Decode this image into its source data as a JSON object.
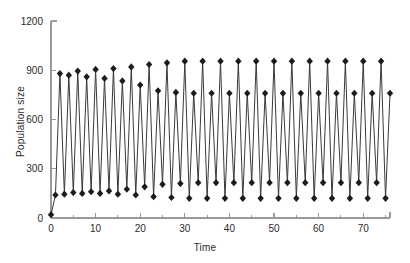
{
  "chart_data": {
    "type": "line",
    "title": "",
    "xlabel": "Time",
    "ylabel": "Population size",
    "xlim": [
      0,
      76
    ],
    "ylim": [
      0,
      1200
    ],
    "xticks": [
      0,
      10,
      20,
      30,
      40,
      50,
      60,
      70
    ],
    "xtick_labels": [
      "0",
      "10",
      "20",
      "30",
      "40",
      "50",
      "60",
      "70"
    ],
    "xminor_ticks": [
      5,
      15,
      25,
      35,
      45,
      55,
      65,
      75
    ],
    "yticks": [
      0,
      300,
      600,
      900,
      1200
    ],
    "ytick_labels": [
      "0",
      "300",
      "600",
      "900",
      "1200"
    ],
    "grid": false,
    "legend": "none",
    "marker": "diamond",
    "marker_color": "#1c1c1c",
    "line_color": "#3a3a3a",
    "series": [
      {
        "name": "Population size",
        "x": [
          0,
          1,
          2,
          3,
          4,
          5,
          6,
          7,
          8,
          9,
          10,
          11,
          12,
          13,
          14,
          15,
          16,
          17,
          18,
          19,
          20,
          21,
          22,
          23,
          24,
          25,
          26,
          27,
          28,
          29,
          30,
          31,
          32,
          33,
          34,
          35,
          36,
          37,
          38,
          39,
          40,
          41,
          42,
          43,
          44,
          45,
          46,
          47,
          48,
          49,
          50,
          51,
          52,
          53,
          54,
          55,
          56,
          57,
          58,
          59,
          60,
          61,
          62,
          63,
          64,
          65,
          66,
          67,
          68,
          69,
          70,
          71,
          72,
          73,
          74,
          75,
          76
        ],
        "values": [
          20,
          140,
          880,
          145,
          870,
          155,
          895,
          150,
          860,
          160,
          905,
          150,
          850,
          165,
          910,
          145,
          835,
          175,
          920,
          140,
          810,
          190,
          935,
          130,
          775,
          205,
          945,
          125,
          765,
          210,
          955,
          120,
          760,
          215,
          955,
          120,
          760,
          215,
          955,
          120,
          760,
          215,
          955,
          120,
          760,
          215,
          955,
          120,
          760,
          215,
          955,
          120,
          760,
          215,
          955,
          120,
          760,
          215,
          955,
          120,
          760,
          215,
          955,
          120,
          760,
          215,
          955,
          120,
          760,
          215,
          955,
          120,
          760,
          215,
          955,
          120,
          760
        ]
      }
    ]
  }
}
